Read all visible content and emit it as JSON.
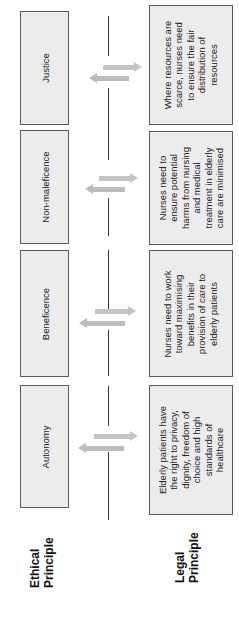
{
  "diagram": {
    "orientation": "rotated-90-ccw",
    "headers": {
      "ethical": [
        "Ethical",
        "Principle"
      ],
      "legal": [
        "Legal",
        "Principle"
      ]
    },
    "colors": {
      "box_fill": "#ececec",
      "box_border": "#5a5a5a",
      "arrow": "#c4c4c4",
      "timeline": "#333333"
    },
    "rows": [
      {
        "ethical": "Justice",
        "legal": [
          "Where resources are",
          "scarce, nurses need",
          "to ensure the fair",
          "distribution of",
          "resources"
        ]
      },
      {
        "ethical": "Non-maleficence",
        "legal": [
          "Nurses need to",
          "ensure potential",
          "harms from nursing",
          "and medical",
          "treatment in elderly",
          "care are minimised"
        ]
      },
      {
        "ethical": "Beneficence",
        "legal": [
          "Nurses need to work",
          "toward maximising",
          "benefits in their",
          "provision of care to",
          "elderly patients"
        ]
      },
      {
        "ethical": "Autonomy",
        "legal": [
          "Elderly patients have",
          "the right to privacy,",
          "dignity, freedom of",
          "choice and high",
          "standards of",
          "healthcare"
        ]
      }
    ]
  }
}
